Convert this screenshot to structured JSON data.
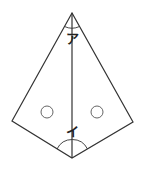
{
  "diagram": {
    "type": "kite-geometry",
    "stroke_color": "#333333",
    "background": "#ffffff",
    "vertices": {
      "top": [
        72,
        13
      ],
      "left": [
        12,
        121
      ],
      "right": [
        133,
        122
      ],
      "bottom": [
        72,
        158
      ]
    },
    "diagonal": {
      "from": "top",
      "to": "bottom"
    },
    "labels": {
      "top_angle": "ア",
      "bottom_angle": "イ"
    },
    "equal_angle_marks": [
      {
        "name": "left",
        "cx": 47,
        "cy": 112,
        "r": 6
      },
      {
        "name": "right",
        "cx": 97,
        "cy": 112,
        "r": 6
      }
    ]
  }
}
